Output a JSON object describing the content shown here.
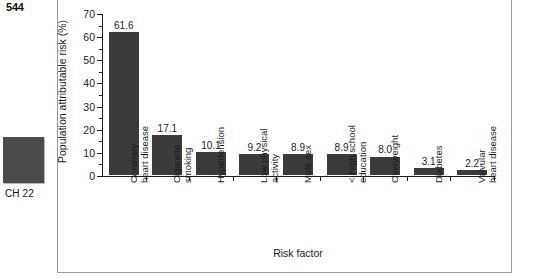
{
  "page": {
    "page_number": "544",
    "chapter_label": "CH 22",
    "chapter_tab_color": "#4a4a4a"
  },
  "chart_data": {
    "type": "bar",
    "title": "",
    "xlabel": "Risk factor",
    "ylabel": "Population attributable risk (%)",
    "ylim": [
      0,
      70
    ],
    "ytick_step": 10,
    "yticks": [
      "0",
      "10",
      "20",
      "30",
      "40",
      "50",
      "60",
      "70"
    ],
    "grid": false,
    "legend": "none",
    "bar_color": "#3b3b3b",
    "categories": [
      "Coronary\nheart disease",
      "Cigarette\nsmoking",
      "Hypertension",
      "Low physical\nactivity",
      "Male sex",
      "< High school\neducation",
      "Overweight",
      "Diabetes",
      "Valvular\nheart disease"
    ],
    "values": [
      61.6,
      17.1,
      10.1,
      9.2,
      8.9,
      8.9,
      8.0,
      3.1,
      2.2
    ],
    "value_labels": [
      "61.6",
      "17.1",
      "10.1",
      "9.2",
      "8.9",
      "8.9",
      "8.0",
      "3.1",
      "2.2"
    ]
  }
}
